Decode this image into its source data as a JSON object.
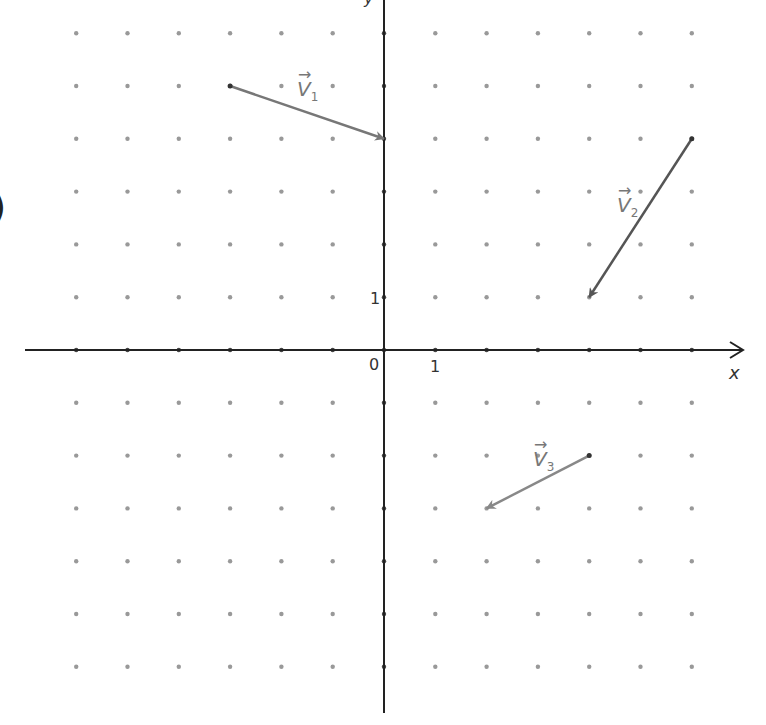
{
  "figure": {
    "paren_fragment": ")",
    "axes": {
      "x_label": "x",
      "y_label": "y",
      "origin_label": "0",
      "x_tick_label": "1",
      "y_tick_label": "1",
      "x_range": [
        -6,
        6
      ],
      "y_range": [
        -6,
        6
      ]
    },
    "grid": {
      "type": "dot",
      "dot_color": "#999999"
    },
    "vectors": [
      {
        "name": "v1",
        "label": "V",
        "subscript": "1",
        "from": [
          -3,
          5
        ],
        "to": [
          0,
          4
        ],
        "color": "#777777"
      },
      {
        "name": "v2",
        "label": "V",
        "subscript": "2",
        "from": [
          6,
          4
        ],
        "to": [
          4,
          1
        ],
        "color": "#555555"
      },
      {
        "name": "v3",
        "label": "V",
        "subscript": "3",
        "from": [
          4,
          -2
        ],
        "to": [
          2,
          -3
        ],
        "color": "#888888"
      }
    ]
  }
}
